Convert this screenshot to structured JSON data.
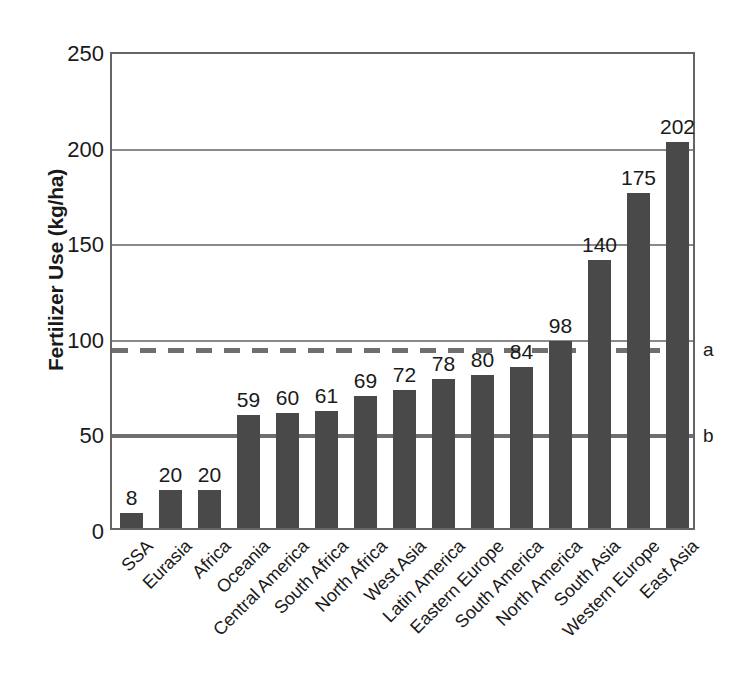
{
  "chart_data": {
    "type": "bar",
    "title": "",
    "subtitle": "",
    "xlabel": "",
    "ylabel": "Fertilizer Use (kg/ha)",
    "ylim": [
      0,
      250
    ],
    "ytick_labels": [
      "0",
      "50",
      "100",
      "150",
      "200",
      "250"
    ],
    "yticks": [
      0,
      50,
      100,
      150,
      200,
      250
    ],
    "grid": true,
    "legend_position": "none",
    "bar_color": "#494949",
    "axis_color": "#656565",
    "gridline_color": "#8a8a8a",
    "categories": [
      "SSA",
      "Eurasia",
      "Africa",
      "Oceania",
      "Central America",
      "South Africa",
      "North Africa",
      "West Asia",
      "Latin America",
      "Eastern Europe",
      "South America",
      "North America",
      "South Asia",
      "Western Europe",
      "East Asia"
    ],
    "values": [
      8,
      20,
      20,
      59,
      60,
      61,
      69,
      72,
      78,
      80,
      84,
      98,
      140,
      175,
      202
    ],
    "value_labels": [
      "8",
      "20",
      "20",
      "59",
      "60",
      "61",
      "69",
      "72",
      "78",
      "80",
      "84",
      "98",
      "140",
      "175",
      "202"
    ],
    "reference_lines": [
      {
        "id": "a",
        "label": "a",
        "value": 95,
        "style": "dashed",
        "color": "#6f6f6f"
      },
      {
        "id": "b",
        "label": "b",
        "value": 50,
        "style": "solid",
        "color": "#6f6f6f"
      }
    ]
  }
}
